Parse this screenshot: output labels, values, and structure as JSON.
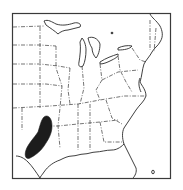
{
  "map": {
    "type": "range-map",
    "region": "Eastern United States",
    "frame": {
      "stroke": "#3a3a3a"
    },
    "colors": {
      "background": "#ffffff",
      "outline": "#2a2a2a",
      "state_border": "#3a3a3a",
      "range_fill": "#1c1c1c"
    },
    "range": {
      "label": "Species range",
      "location": "Central and south Texas, extending north toward Oklahoma border"
    }
  }
}
